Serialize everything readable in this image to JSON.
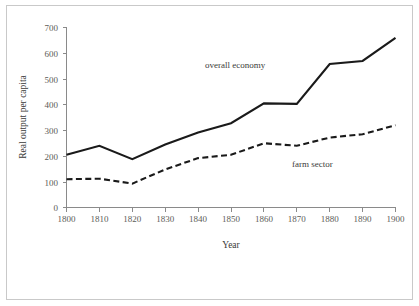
{
  "chart_data": {
    "type": "line",
    "title": "",
    "xlabel": "Year",
    "ylabel": "Real output per capita",
    "x": [
      1800,
      1810,
      1820,
      1830,
      1840,
      1850,
      1860,
      1870,
      1880,
      1890,
      1900
    ],
    "xticklabels": [
      "1800",
      "1810",
      "1820",
      "1830",
      "1840",
      "1850",
      "1860",
      "1870",
      "1880",
      "1890",
      "1900"
    ],
    "yticks": [
      0,
      100,
      200,
      300,
      400,
      500,
      600,
      700
    ],
    "yticklabels": [
      "0",
      "100",
      "200",
      "300",
      "400",
      "500",
      "600",
      "700"
    ],
    "xlim": [
      1800,
      1900
    ],
    "ylim": [
      0,
      700
    ],
    "grid": false,
    "legend": "inline annotations",
    "series": [
      {
        "name": "overall economy",
        "style": "solid",
        "color": "#1a1a1a",
        "values": [
          205,
          240,
          188,
          245,
          292,
          328,
          405,
          403,
          558,
          570,
          660
        ]
      },
      {
        "name": "farm sector",
        "style": "dashed",
        "color": "#1a1a1a",
        "values": [
          110,
          112,
          93,
          148,
          192,
          205,
          250,
          240,
          272,
          285,
          320
        ]
      }
    ],
    "annotations": [
      {
        "text": "overall economy",
        "x": 1848,
        "y": 540
      },
      {
        "text": "farm sector",
        "x": 1872,
        "y": 178
      }
    ]
  }
}
